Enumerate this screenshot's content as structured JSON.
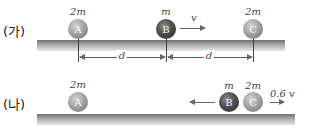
{
  "panels": [
    {
      "label": "(가)",
      "balls": [
        {
          "name": "A",
          "mass": "2m",
          "shade": "light"
        },
        {
          "name": "B",
          "mass": "m",
          "shade": "dark"
        },
        {
          "name": "C",
          "mass": "2m",
          "shade": "light"
        }
      ],
      "velocity_label": "v",
      "distances": [
        "d",
        "d"
      ]
    },
    {
      "label": "(나)",
      "balls": [
        {
          "name": "A",
          "mass": "2m",
          "shade": "light"
        },
        {
          "name": "B",
          "mass": "m",
          "shade": "dark"
        },
        {
          "name": "C",
          "mass": "2m",
          "shade": "light"
        }
      ],
      "velocity_label_c": "0.6 v"
    }
  ]
}
